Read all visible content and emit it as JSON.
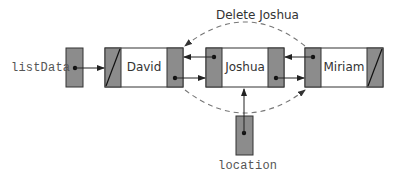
{
  "diagram": {
    "title": "Delete Joshua",
    "operation_label": "Delete Joshua",
    "external_pointers": [
      {
        "name": "listData",
        "points_to": "David"
      },
      {
        "name": "location",
        "points_to": "Joshua"
      }
    ],
    "nodes": [
      {
        "info": "David",
        "back": null,
        "next": "Joshua"
      },
      {
        "info": "Joshua",
        "back": "David",
        "next": "Miriam"
      },
      {
        "info": "Miriam",
        "back": "Joshua",
        "next": null
      }
    ],
    "bypass_links": [
      {
        "from": "Miriam.back",
        "to": "David",
        "style": "dashed",
        "position": "above"
      },
      {
        "from": "David.next",
        "to": "Miriam",
        "style": "dashed",
        "position": "below"
      }
    ],
    "colors": {
      "pointer_cell": "#8c8c8c",
      "data_cell": "#ffffff",
      "border": "#333333",
      "arrow": "#222222",
      "dashed": "#777777",
      "label_text": "#555555"
    }
  }
}
